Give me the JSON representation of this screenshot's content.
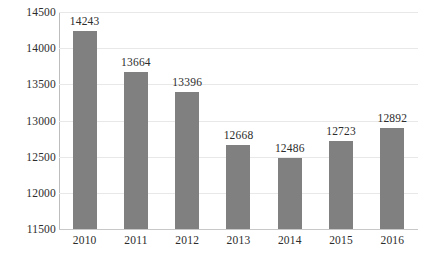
{
  "chart_data": {
    "type": "bar",
    "title": "",
    "subtitle": "",
    "xlabel": "",
    "ylabel": "",
    "categories": [
      "2010",
      "2011",
      "2012",
      "2013",
      "2014",
      "2015",
      "2016"
    ],
    "values": [
      14243,
      13664,
      13396,
      12668,
      12486,
      12723,
      12892
    ],
    "data_labels": [
      "14243",
      "13664",
      "13396",
      "12668",
      "12486",
      "12723",
      "12892"
    ],
    "ylim": [
      11500,
      14500
    ],
    "ytick_values": [
      11500,
      12000,
      12500,
      13000,
      13500,
      14000,
      14500
    ],
    "ytick_labels": [
      "11500",
      "12000",
      "12500",
      "13000",
      "13500",
      "14000",
      "14500"
    ],
    "grid": true,
    "grid_axis": "y",
    "legend": false,
    "legend_position": "none",
    "bar_color": "#808080",
    "gridline_color": "#E8E8E8",
    "axis_color": "#BDBDBD",
    "text_color": "#2C2C2C",
    "background_color": "#FFFFFF"
  }
}
